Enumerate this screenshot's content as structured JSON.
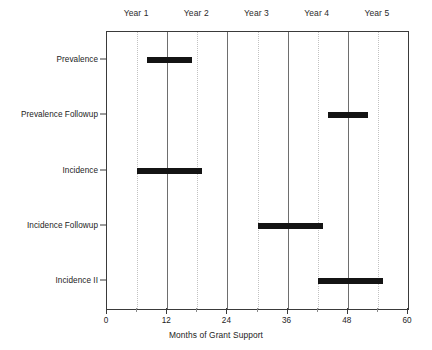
{
  "chart_data": {
    "type": "bar",
    "orientation": "horizontal",
    "subtype": "gantt-timeline",
    "title": "",
    "xlabel": "Months of Grant Support",
    "ylabel": "",
    "xlim": [
      0,
      60
    ],
    "xticks": [
      0,
      12,
      24,
      36,
      48,
      60
    ],
    "xtick_labels": [
      "0",
      "12",
      "24",
      "36",
      "48",
      "60"
    ],
    "minor_xticks": [
      6,
      18,
      30,
      42,
      54
    ],
    "grid": "vertical-only",
    "legend": "none",
    "categories": [
      "Prevalence",
      "Prevalence Followup",
      "Incidence",
      "Incidence Followup",
      "Incidence II"
    ],
    "bars": [
      {
        "label": "Prevalence",
        "start": 8,
        "end": 17,
        "duration": 9
      },
      {
        "label": "Prevalence Followup",
        "start": 44,
        "end": 52,
        "duration": 8
      },
      {
        "label": "Incidence",
        "start": 6,
        "end": 19,
        "duration": 13
      },
      {
        "label": "Incidence Followup",
        "start": 30,
        "end": 43,
        "duration": 13
      },
      {
        "label": "Incidence II",
        "start": 42,
        "end": 55,
        "duration": 13
      }
    ],
    "bands": [
      {
        "label": "Year 1",
        "start": 0,
        "end": 12
      },
      {
        "label": "Year 2",
        "start": 12,
        "end": 24
      },
      {
        "label": "Year 3",
        "start": 24,
        "end": 36
      },
      {
        "label": "Year 4",
        "start": 36,
        "end": 48
      },
      {
        "label": "Year 5",
        "start": 48,
        "end": 60
      }
    ],
    "colors": {
      "bar": "#141414",
      "axis": "#3a3a3a",
      "major_gridline": "#6e6e6e",
      "minor_gridline": "#c2c2c2",
      "text": "#232323",
      "background": "#ffffff"
    }
  },
  "axis": {
    "x_title": "Months of Grant Support"
  }
}
